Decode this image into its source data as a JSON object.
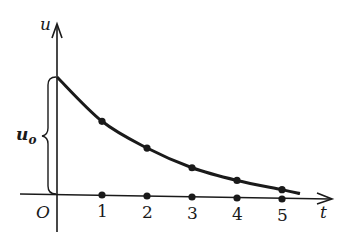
{
  "chart_data": {
    "type": "line",
    "title": "",
    "xlabel": "t",
    "ylabel": "u",
    "origin_label": "O",
    "initial_value_label": "u",
    "initial_value_subscript": "o",
    "x_ticks": [
      "1",
      "2",
      "3",
      "4",
      "5"
    ],
    "x": [
      0,
      1,
      2,
      3,
      4,
      5,
      5.4
    ],
    "series": [
      {
        "name": "u(t) decay",
        "values": [
          1.0,
          0.63,
          0.41,
          0.25,
          0.15,
          0.08,
          0.05
        ],
        "marked_points": [
          1,
          2,
          3,
          4,
          5
        ]
      }
    ],
    "axis_markers_on_t": [
      1,
      2,
      3,
      4,
      5
    ],
    "ylim": [
      0,
      1.0
    ],
    "xlim": [
      0,
      5.5
    ],
    "grid": false,
    "legend": "none",
    "color": "#1a1a1a"
  }
}
